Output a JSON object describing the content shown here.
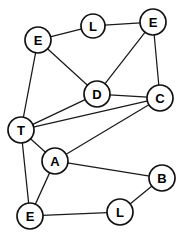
{
  "figure": {
    "kind": "undirected-graph-diagram",
    "background_color": "#ffffff",
    "node_fill_color": "#ffffff",
    "node_stroke_color": "#111111",
    "edge_color": "#1a1a1a",
    "label_color": "#000000",
    "width": 183,
    "height": 236
  },
  "graph": {
    "node_count": 10,
    "edge_count": 16,
    "node_radius": 13,
    "nodes": [
      {
        "id": "n1",
        "label": "E",
        "x": 38,
        "y": 40,
        "r": 13
      },
      {
        "id": "n2",
        "label": "L",
        "x": 93,
        "y": 26,
        "r": 12
      },
      {
        "id": "n3",
        "label": "E",
        "x": 153,
        "y": 22,
        "r": 13
      },
      {
        "id": "n4",
        "label": "D",
        "x": 97,
        "y": 94,
        "r": 13
      },
      {
        "id": "n5",
        "label": "C",
        "x": 160,
        "y": 98,
        "r": 13
      },
      {
        "id": "n6",
        "label": "T",
        "x": 21,
        "y": 130,
        "r": 13
      },
      {
        "id": "n7",
        "label": "A",
        "x": 55,
        "y": 161,
        "r": 13
      },
      {
        "id": "n8",
        "label": "B",
        "x": 162,
        "y": 178,
        "r": 13
      },
      {
        "id": "n9",
        "label": "E",
        "x": 30,
        "y": 216,
        "r": 13
      },
      {
        "id": "n10",
        "label": "L",
        "x": 120,
        "y": 212,
        "r": 13
      }
    ],
    "edges": [
      {
        "source": "n1",
        "target": "n2"
      },
      {
        "source": "n1",
        "target": "n4"
      },
      {
        "source": "n1",
        "target": "n6"
      },
      {
        "source": "n2",
        "target": "n3"
      },
      {
        "source": "n3",
        "target": "n4"
      },
      {
        "source": "n3",
        "target": "n5"
      },
      {
        "source": "n4",
        "target": "n5"
      },
      {
        "source": "n4",
        "target": "n6"
      },
      {
        "source": "n5",
        "target": "n6"
      },
      {
        "source": "n5",
        "target": "n7"
      },
      {
        "source": "n6",
        "target": "n7"
      },
      {
        "source": "n6",
        "target": "n9"
      },
      {
        "source": "n7",
        "target": "n8"
      },
      {
        "source": "n7",
        "target": "n9"
      },
      {
        "source": "n8",
        "target": "n10"
      },
      {
        "source": "n9",
        "target": "n10"
      }
    ]
  }
}
